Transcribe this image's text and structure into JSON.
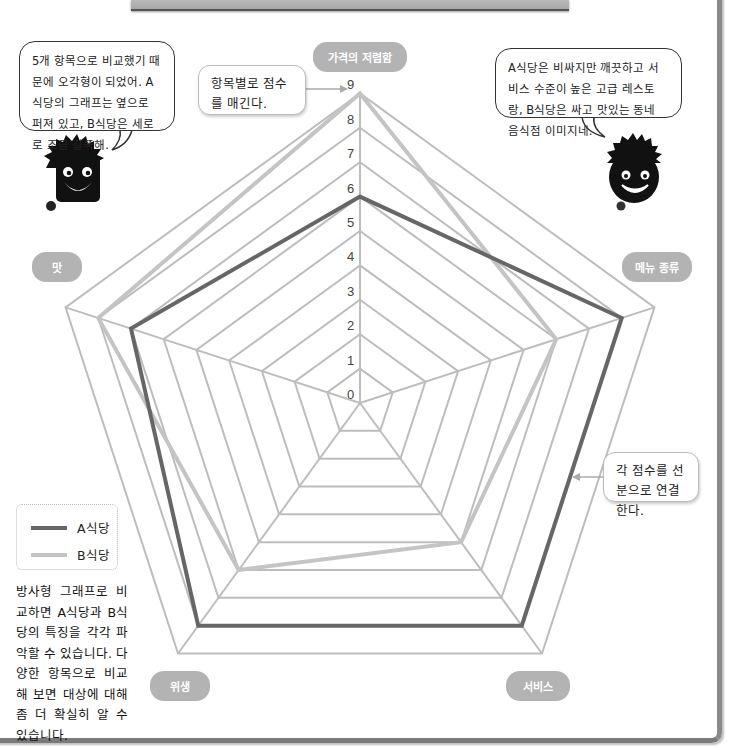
{
  "chart_data": {
    "type": "radar",
    "title": "",
    "axes": [
      "가격의 저렴함",
      "메뉴 종류",
      "서비스",
      "위생",
      "맛"
    ],
    "scale": {
      "min": 0,
      "max": 9,
      "ticks": [
        0,
        1,
        2,
        3,
        4,
        5,
        6,
        7,
        8,
        9
      ]
    },
    "series": [
      {
        "name": "A식당",
        "values": [
          6,
          8,
          8,
          8,
          7
        ],
        "color": "#666666"
      },
      {
        "name": "B식당",
        "values": [
          9,
          6,
          5,
          6,
          8
        ],
        "color": "#c4c4c4"
      }
    ],
    "grid_color": "#bdbdbd",
    "legend_position": "bottom-left"
  },
  "axis_labels": {
    "top": "가격의 저렴함",
    "right": "메뉴 종류",
    "bottom_right": "서비스",
    "bottom_left": "위생",
    "left": "맛"
  },
  "callouts": {
    "score_note": "항목별로 점수를 매긴다.",
    "line_note": "각 점수를 선분으로 연결한다."
  },
  "bubbles": {
    "left_character": "5개 항목으로 비교했기 때문에 오각형이 되었어. A식당의 그래프는 옆으로 퍼져 있고, B식당은 세로로 조금 길쭉해.",
    "right_character": "A식당은 비싸지만 깨끗하고 서비스 수준이 높은 고급 레스토랑, B식당은 싸고 맛있는 동네 음식점 이미지네."
  },
  "legend": {
    "a_label": "A식당",
    "b_label": "B식당"
  },
  "description": "방사형 그래프로 비교하면 A식당과 B식당의 특징을 각각 파악할 수 있습니다. 다양한 항목으로 비교해 보면 대상에 대해 좀 더 확실히 알 수 있습니다."
}
